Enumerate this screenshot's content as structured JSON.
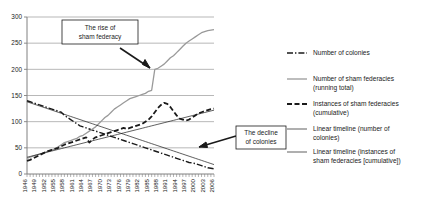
{
  "chart_data": {
    "type": "line",
    "title": "",
    "xlabel": "",
    "ylabel": "",
    "ylim": [
      0,
      300
    ],
    "yticks": [
      0,
      50,
      100,
      150,
      200,
      250,
      300
    ],
    "grid": true,
    "legend_position": "right",
    "xlim": [
      1946,
      2006
    ],
    "x": [
      1946,
      1947,
      1948,
      1949,
      1950,
      1951,
      1952,
      1953,
      1954,
      1955,
      1956,
      1957,
      1958,
      1959,
      1960,
      1961,
      1962,
      1963,
      1964,
      1965,
      1966,
      1967,
      1968,
      1969,
      1970,
      1971,
      1972,
      1973,
      1974,
      1975,
      1976,
      1977,
      1978,
      1979,
      1980,
      1981,
      1982,
      1983,
      1984,
      1985,
      1986,
      1987,
      1988,
      1989,
      1990,
      1991,
      1992,
      1993,
      1994,
      1995,
      1996,
      1997,
      1998,
      1999,
      2000,
      2001,
      2002,
      2003,
      2004,
      2005,
      2006
    ],
    "xtick_labels": [
      "1946",
      "1949",
      "1952",
      "1955",
      "1958",
      "1961",
      "1964",
      "1967",
      "1970",
      "1973",
      "1976",
      "1979",
      "1982",
      "1985",
      "1988",
      "1991",
      "1994",
      "1997",
      "2000",
      "2003",
      "2006"
    ],
    "xtick_rotation": 90,
    "series": [
      {
        "name": "Number of colonies",
        "style": "dash-dot",
        "color": "#1a1a1a",
        "width": 1.4,
        "values": [
          140,
          138,
          136,
          134,
          132,
          130,
          128,
          126,
          124,
          122,
          120,
          118,
          112,
          108,
          104,
          100,
          96,
          92,
          90,
          88,
          86,
          84,
          82,
          80,
          78,
          76,
          74,
          72,
          70,
          68,
          66,
          64,
          62,
          60,
          58,
          56,
          54,
          52,
          50,
          48,
          46,
          44,
          42,
          40,
          38,
          36,
          34,
          32,
          30,
          28,
          26,
          24,
          22,
          21,
          20,
          18,
          16,
          14,
          12,
          11,
          10
        ]
      },
      {
        "name": "Number of sham federacies (running total)",
        "style": "solid",
        "color": "#9a9a9a",
        "width": 1.3,
        "values": [
          30,
          32,
          34,
          36,
          38,
          40,
          42,
          44,
          46,
          48,
          52,
          56,
          60,
          62,
          64,
          66,
          68,
          72,
          74,
          78,
          82,
          86,
          90,
          96,
          102,
          108,
          112,
          118,
          124,
          128,
          132,
          136,
          140,
          144,
          146,
          148,
          150,
          152,
          154,
          158,
          160,
          200,
          202,
          206,
          210,
          216,
          222,
          226,
          232,
          238,
          244,
          250,
          254,
          258,
          262,
          266,
          270,
          272,
          274,
          275,
          276
        ]
      },
      {
        "name": "Instances of sham federacies (cumulative)",
        "style": "dashed",
        "color": "#1a1a1a",
        "width": 1.8,
        "values": [
          25,
          27,
          30,
          33,
          36,
          39,
          42,
          44,
          46,
          48,
          50,
          53,
          56,
          58,
          60,
          62,
          64,
          66,
          68,
          70,
          60,
          66,
          70,
          72,
          74,
          76,
          78,
          80,
          82,
          84,
          86,
          88,
          86,
          88,
          90,
          92,
          94,
          96,
          100,
          104,
          110,
          118,
          126,
          132,
          136,
          134,
          128,
          120,
          112,
          106,
          104,
          102,
          104,
          108,
          112,
          116,
          118,
          120,
          122,
          124,
          125
        ]
      },
      {
        "name": "Linear timeline (number of colonies)",
        "style": "solid",
        "color": "#1a1a1a",
        "width": 0.7,
        "values": [
          138,
          136,
          134,
          132,
          130,
          128,
          126,
          124,
          122,
          120,
          118,
          116,
          114,
          112,
          110,
          108,
          106,
          104,
          102,
          100,
          98,
          96,
          94,
          92,
          90,
          88,
          86,
          84,
          82,
          80,
          78,
          76,
          74,
          72,
          70,
          68,
          66,
          64,
          62,
          60,
          58,
          56,
          54,
          52,
          50,
          48,
          46,
          44,
          42,
          40,
          38,
          36,
          34,
          32,
          30,
          28,
          26,
          24,
          22,
          20,
          18
        ]
      },
      {
        "name": "Linear timeline (instances of sham federacies [cumulative])",
        "style": "solid",
        "color": "#1a1a1a",
        "width": 0.7,
        "values": [
          32,
          33.5,
          35,
          36.5,
          38,
          39.5,
          41,
          42.5,
          44,
          45.5,
          47,
          48.5,
          50,
          51.5,
          53,
          54.5,
          56,
          57.5,
          59,
          60.5,
          62,
          63.5,
          65,
          66.5,
          68,
          69.5,
          71,
          72.5,
          74,
          75.5,
          77,
          78.5,
          80,
          81.5,
          83,
          84.5,
          86,
          87.5,
          89,
          90.5,
          92,
          93.5,
          95,
          96.5,
          98,
          99.5,
          101,
          102.5,
          104,
          105.5,
          107,
          108.5,
          110,
          111.5,
          113,
          114.5,
          116,
          117.5,
          119,
          120.5,
          122
        ]
      }
    ],
    "annotations": [
      {
        "name": "rise-callout",
        "text_line1": "The rise of",
        "text_line2": "sham federacy"
      },
      {
        "name": "decline-callout",
        "text_line1": "The decline",
        "text_line2": "of colonies"
      }
    ]
  },
  "legend": {
    "entries": [
      {
        "label_line1": "Number of colonies",
        "label_line2": ""
      },
      {
        "label_line1": "Number of sham federacies",
        "label_line2": "(running total)"
      },
      {
        "label_line1": "Instances of sham federacies",
        "label_line2": "(cumulative)"
      },
      {
        "label_line1": "Linear timeline (number of",
        "label_line2": "colonies)"
      },
      {
        "label_line1": "Linear timeline (instances of",
        "label_line2": "sham federacies [cumulative])"
      }
    ]
  },
  "colors": {
    "axis": "#808080",
    "grid": "#9a9a9a",
    "ink": "#1a1a1a",
    "gray_series": "#9a9a9a",
    "background": "#ffffff"
  }
}
